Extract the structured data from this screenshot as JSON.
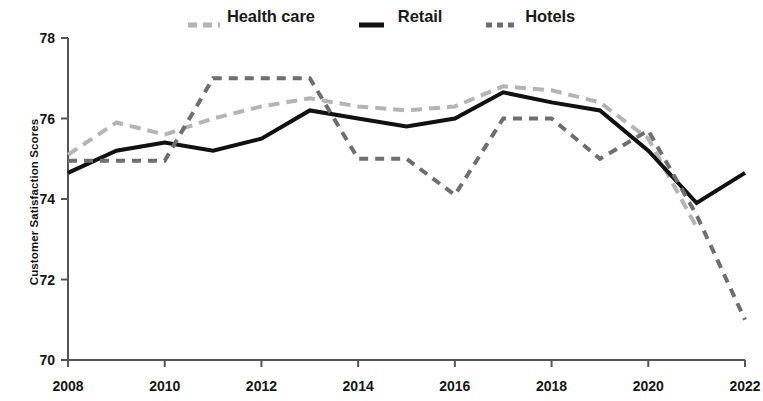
{
  "chart_data": {
    "type": "line",
    "title": "",
    "xlabel": "",
    "ylabel": "Customer Satisfaction Scores",
    "x": [
      2008,
      2009,
      2010,
      2011,
      2012,
      2013,
      2014,
      2015,
      2016,
      2017,
      2018,
      2019,
      2020,
      2021,
      2022
    ],
    "xlim": [
      2008,
      2022
    ],
    "ylim": [
      70,
      78
    ],
    "x_tick_labels": [
      "2008",
      "2010",
      "2012",
      "2014",
      "2016",
      "2018",
      "2020",
      "2022"
    ],
    "x_tick_values": [
      2008,
      2010,
      2012,
      2014,
      2016,
      2018,
      2020,
      2022
    ],
    "y_tick_labels": [
      "70",
      "72",
      "74",
      "76",
      "78"
    ],
    "y_tick_values": [
      70,
      72,
      74,
      76,
      78
    ],
    "grid": false,
    "legend_position": "top-center",
    "series": [
      {
        "name": "Health care",
        "color": "#b4b4b4",
        "style": "dashed",
        "width": 4,
        "dash": "11,7",
        "values": [
          75.1,
          75.9,
          75.6,
          76.0,
          76.3,
          76.5,
          76.3,
          76.2,
          76.3,
          76.8,
          76.7,
          76.4,
          75.5,
          73.3,
          null
        ]
      },
      {
        "name": "Retail",
        "color": "#111111",
        "style": "solid",
        "width": 4,
        "dash": "",
        "values": [
          74.65,
          75.2,
          75.4,
          75.2,
          75.5,
          76.2,
          76.0,
          75.8,
          76.0,
          76.65,
          76.4,
          76.2,
          75.2,
          73.9,
          74.65
        ]
      },
      {
        "name": "Hotels",
        "color": "#6e6e6e",
        "style": "dashed",
        "width": 4,
        "dash": "9,7",
        "values": [
          74.95,
          74.95,
          74.95,
          77.0,
          77.0,
          77.0,
          75.0,
          75.0,
          74.1,
          76.0,
          76.0,
          75.0,
          75.7,
          73.6,
          71.0
        ]
      }
    ]
  },
  "legend": {
    "items": [
      {
        "label": "Health care",
        "color": "#b4b4b4",
        "swatch": "dashed-light"
      },
      {
        "label": "Retail",
        "color": "#111111",
        "swatch": "solid-black"
      },
      {
        "label": "Hotels",
        "color": "#6e6e6e",
        "swatch": "dashed-dark"
      }
    ]
  },
  "axes": {
    "y_title": "Customer Satisfaction Scores",
    "axis_color": "#555555"
  }
}
